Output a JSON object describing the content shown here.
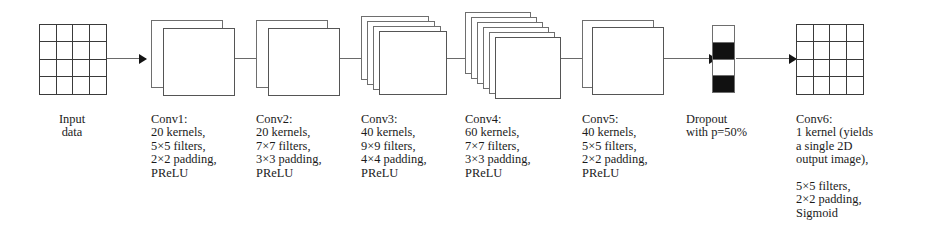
{
  "figure": {
    "kind": "cnn-architecture-diagram",
    "orientation": "left-to-right",
    "background_color": "#ffffff",
    "text_color": "#1b1b1b",
    "line_color": "#6a6a6a",
    "fill_color": "#111111"
  },
  "stages": [
    {
      "id": "input",
      "glyph": "grid-4x4",
      "caption_lines": [
        "Input",
        "data"
      ],
      "caption_align": "center"
    },
    {
      "id": "conv1",
      "glyph": "stack",
      "planes": 2,
      "caption_lines": [
        "Conv1:",
        "20 kernels,",
        "5×5 filters,",
        "2×2 padding,",
        "PReLU"
      ],
      "caption_align": "left",
      "kernels": 20,
      "filter_size": "5×5",
      "padding": "2×2",
      "activation": "PReLU"
    },
    {
      "id": "conv2",
      "glyph": "stack",
      "planes": 2,
      "caption_lines": [
        "Conv2:",
        "20 kernels,",
        "7×7 filters,",
        "3×3 padding,",
        "PReLU"
      ],
      "caption_align": "left",
      "kernels": 20,
      "filter_size": "7×7",
      "padding": "3×3",
      "activation": "PReLU"
    },
    {
      "id": "conv3",
      "glyph": "stack",
      "planes": 4,
      "caption_lines": [
        "Conv3:",
        "40 kernels,",
        "9×9 filters,",
        "4×4 padding,",
        "PReLU"
      ],
      "caption_align": "left",
      "kernels": 40,
      "filter_size": "9×9",
      "padding": "4×4",
      "activation": "PReLU"
    },
    {
      "id": "conv4",
      "glyph": "stack",
      "planes": 6,
      "caption_lines": [
        "Conv4:",
        "60 kernels,",
        "7×7 filters,",
        "3×3 padding,",
        "PReLU"
      ],
      "caption_align": "left",
      "kernels": 60,
      "filter_size": "7×7",
      "padding": "3×3",
      "activation": "PReLU"
    },
    {
      "id": "conv5",
      "glyph": "stack",
      "planes": 2,
      "caption_lines": [
        "Conv5:",
        "40 kernels,",
        "5×5 filters,",
        "2×2 padding,",
        "PReLU"
      ],
      "caption_align": "left",
      "kernels": 40,
      "filter_size": "5×5",
      "padding": "2×2",
      "activation": "PReLU"
    },
    {
      "id": "dropout",
      "glyph": "dropout-strip",
      "cells": [
        "off",
        "on",
        "off",
        "on"
      ],
      "caption_lines": [
        "Dropout",
        "with p=50%"
      ],
      "caption_align": "left",
      "probability": "p=50%"
    },
    {
      "id": "conv6",
      "glyph": "grid-4x4",
      "caption_lines": [
        "Conv6:",
        "1 kernel (yields",
        "a single 2D",
        "output image),",
        "",
        "5×5 filters,",
        "2×2 padding,",
        "Sigmoid"
      ],
      "caption_align": "left",
      "kernels": 1,
      "filter_size": "5×5",
      "padding": "2×2",
      "activation": "Sigmoid"
    }
  ],
  "arrows": [
    {
      "from": "input",
      "to": "conv1"
    },
    {
      "from": "conv1",
      "to": "conv2"
    },
    {
      "from": "conv2",
      "to": "conv3"
    },
    {
      "from": "conv3",
      "to": "conv4"
    },
    {
      "from": "conv4",
      "to": "conv5"
    },
    {
      "from": "conv5",
      "to": "dropout"
    },
    {
      "from": "dropout",
      "to": "conv6"
    }
  ]
}
